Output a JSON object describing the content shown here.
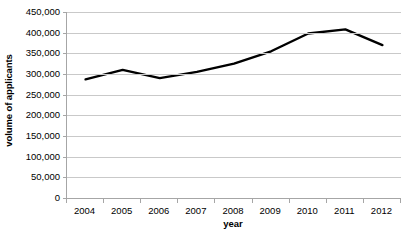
{
  "chart_data": {
    "type": "line",
    "title": "",
    "xlabel": "year",
    "ylabel": "volume of applicants",
    "categories": [
      "2004",
      "2005",
      "2006",
      "2007",
      "2008",
      "2009",
      "2010",
      "2011",
      "2012"
    ],
    "values": [
      287000,
      310000,
      290000,
      305000,
      325000,
      355000,
      398000,
      408000,
      370000
    ],
    "series": [
      {
        "name": "volume of applicants",
        "values": [
          287000,
          310000,
          290000,
          305000,
          325000,
          355000,
          398000,
          408000,
          370000
        ]
      }
    ],
    "ylim": [
      0,
      450000
    ],
    "y_ticks": [
      0,
      50000,
      100000,
      150000,
      200000,
      250000,
      300000,
      350000,
      400000,
      450000
    ],
    "y_tick_labels": [
      "0",
      "50,000",
      "100,000",
      "150,000",
      "200,000",
      "250,000",
      "300,000",
      "350,000",
      "400,000",
      "450,000"
    ],
    "grid": "horizontal",
    "legend": "none",
    "line_color": "#000000",
    "gridline_color": "#c9c9c9",
    "axis_color": "#a6a6a6",
    "background_color": "#ffffff"
  },
  "axes": {
    "y_title": "volume of applicants",
    "x_title": "year"
  },
  "bottom_sliver": ""
}
